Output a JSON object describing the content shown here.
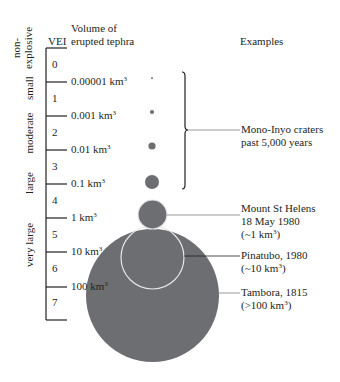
{
  "header": {
    "vei": "VEI",
    "volume_line1": "Volume of",
    "volume_line2": "erupted tephra",
    "examples": "Examples"
  },
  "categories": [
    {
      "line1": "non-",
      "line2": "explosive"
    },
    {
      "label": "small"
    },
    {
      "label": "moderate"
    },
    {
      "label": "large"
    },
    {
      "label": "very large"
    }
  ],
  "vei_levels": [
    "0",
    "1",
    "2",
    "3",
    "4",
    "5",
    "6",
    "7"
  ],
  "volumes": [
    {
      "value": "0.00001 km",
      "unit_exp": "3"
    },
    {
      "value": "0.001 km",
      "unit_exp": "3"
    },
    {
      "value": "0.01 km",
      "unit_exp": "3"
    },
    {
      "value": "0.1 km",
      "unit_exp": "3"
    },
    {
      "value": "1 km",
      "unit_exp": "3"
    },
    {
      "value": "10 km",
      "unit_exp": "3"
    },
    {
      "value": "100 km",
      "unit_exp": "3"
    }
  ],
  "examples": [
    {
      "line1": "Mono-Inyo craters",
      "line2": "past 5,000 years"
    },
    {
      "line1": "Mount St Helens",
      "line2": "18 May 1980",
      "line3_pre": "(~1 km",
      "line3_exp": "3",
      "line3_post": ")"
    },
    {
      "line1": "Pinatubo, 1980",
      "line2_pre": "(~10 km",
      "line2_exp": "3",
      "line2_post": ")"
    },
    {
      "line1": "Tambora, 1815",
      "line2_pre": "(>100 km",
      "line2_exp": "3",
      "line2_post": ")"
    }
  ],
  "colors": {
    "circle_fill": "#6d6e71",
    "axis": "#231f20",
    "leader": "#808080",
    "outline": "#e6e6e6"
  }
}
